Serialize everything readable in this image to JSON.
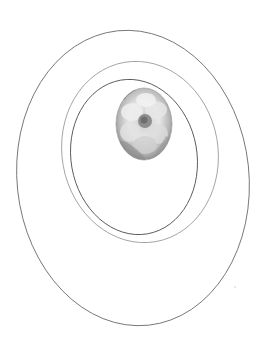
{
  "canvas": {
    "width": 262,
    "height": 350,
    "background": "#ffffff"
  },
  "rings": [
    {
      "name": "outer-ring",
      "cx": 133,
      "cy": 178,
      "rx": 116,
      "ry": 148,
      "rotate": -6,
      "stroke": "#6e6e6e",
      "width": 0.9
    },
    {
      "name": "middle-ring",
      "cx": 140,
      "cy": 152,
      "rx": 78,
      "ry": 91,
      "rotate": -10,
      "stroke": "#9a9a9a",
      "width": 0.9
    },
    {
      "name": "inner-ring",
      "cx": 134,
      "cy": 157,
      "rx": 63,
      "ry": 78,
      "rotate": -10,
      "stroke": "#5a5a5a",
      "width": 0.9
    }
  ],
  "photo": {
    "subject": "white flower (grayscale)",
    "cx": 144,
    "cy": 124,
    "rx": 28,
    "ry": 36,
    "colors": {
      "edge": "#7c7c7c",
      "mid": "#b4b4b4",
      "petal": "#e6e6e6",
      "center": "#8a8a8a"
    }
  }
}
